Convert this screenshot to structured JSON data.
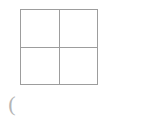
{
  "page": {
    "background_color": "#ffffff",
    "width": 145,
    "height": 117
  },
  "figure": {
    "name": "two-by-two-grid",
    "line_color": "#9d9d9d",
    "fill_color": "#ffffff",
    "rows": 2,
    "columns": 2,
    "cells": [
      {
        "id": "top-left",
        "label": ""
      },
      {
        "id": "top-right",
        "label": ""
      },
      {
        "id": "bottom-left",
        "label": ""
      },
      {
        "id": "bottom-right",
        "label": ""
      }
    ]
  },
  "annotation": {
    "paren_mark": "(",
    "color": "#b4b4b4"
  }
}
